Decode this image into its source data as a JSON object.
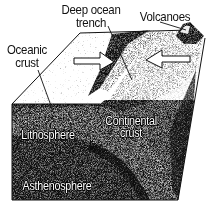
{
  "diagram": {
    "type": "block-diagram",
    "style": "black-and-white grainy illustration",
    "labels": {
      "deep_ocean_trench_line1": "Deep ocean",
      "deep_ocean_trench_line2": "trench",
      "volcanoes": "Volcanoes",
      "oceanic_crust_line1": "Oceanic",
      "oceanic_crust_line2": "crust",
      "lithosphere": "Lithosphere",
      "continental_crust_line1": "Continental",
      "continental_crust_line2": "crust",
      "asthenosphere": "Asthenosphere"
    },
    "arrows": [
      {
        "name": "oceanic-plate-motion",
        "direction": "right"
      },
      {
        "name": "continental-plate-motion",
        "direction": "left"
      }
    ],
    "colors": {
      "ink": "#111111",
      "paper": "#ffffff",
      "mid_grey": "#8a8a8a"
    }
  }
}
